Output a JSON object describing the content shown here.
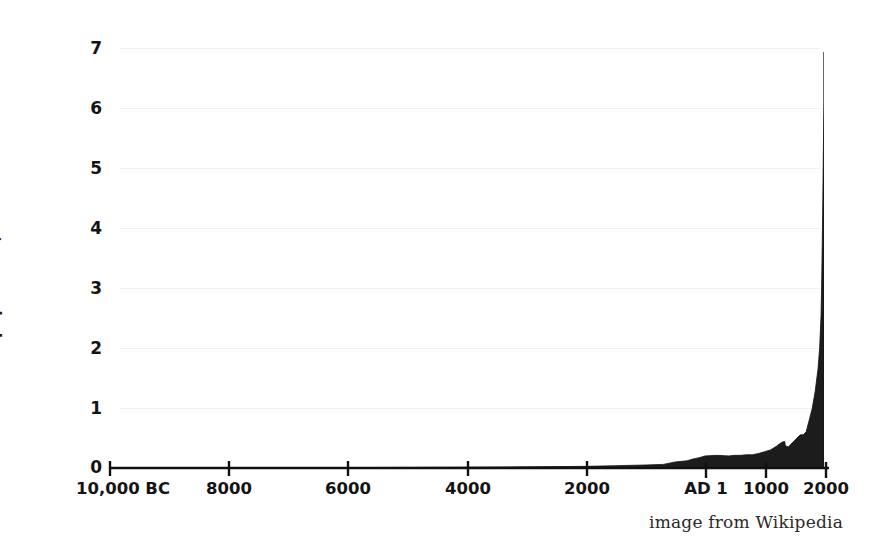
{
  "chart_data": {
    "type": "area",
    "title": "",
    "subtitle": "",
    "xlabel": "",
    "ylabel": "World population, billions",
    "credit": "image from Wikipedia",
    "grid": "faint-horizontal",
    "legend": "none",
    "legend_position": "none",
    "fill_color": "#1c1c1c",
    "line_color": "#111111",
    "background_color": "#ffffff",
    "xlim": [
      -10000,
      2000
    ],
    "ylim": [
      0,
      7
    ],
    "x_tick_values": [
      -10000,
      -8000,
      -6000,
      -4000,
      -2000,
      1,
      1000,
      2000
    ],
    "x_tick_labels": [
      "10,000 BC",
      "8000",
      "6000",
      "4000",
      "2000",
      "AD 1",
      "1000",
      "2000"
    ],
    "y_tick_values": [
      0,
      1,
      2,
      3,
      4,
      5,
      6,
      7
    ],
    "y_tick_labels": [
      "0",
      "1",
      "2",
      "3",
      "4",
      "5",
      "6",
      "7"
    ],
    "x": [
      -10000,
      -9000,
      -8000,
      -7000,
      -6000,
      -5000,
      -4000,
      -3000,
      -2000,
      -1500,
      -1000,
      -700,
      -500,
      -300,
      -200,
      -100,
      1,
      200,
      400,
      500,
      600,
      700,
      800,
      900,
      1000,
      1100,
      1200,
      1250,
      1300,
      1340,
      1350,
      1400,
      1500,
      1600,
      1650,
      1700,
      1750,
      1800,
      1850,
      1900,
      1927,
      1950,
      1960,
      1970,
      1980,
      1990,
      1999,
      2000,
      2010
    ],
    "y": [
      0.004,
      0.005,
      0.005,
      0.006,
      0.007,
      0.01,
      0.014,
      0.02,
      0.027,
      0.038,
      0.05,
      0.06,
      0.1,
      0.12,
      0.15,
      0.17,
      0.2,
      0.21,
      0.2,
      0.21,
      0.21,
      0.22,
      0.22,
      0.24,
      0.27,
      0.3,
      0.36,
      0.4,
      0.43,
      0.44,
      0.37,
      0.35,
      0.45,
      0.55,
      0.55,
      0.6,
      0.79,
      0.98,
      1.26,
      1.65,
      2.0,
      2.52,
      3.02,
      3.7,
      4.44,
      5.31,
      6.0,
      6.08,
      6.9
    ],
    "series": [
      {
        "name": "World population",
        "units": "billions",
        "points": [
          {
            "year": "10,000 BC",
            "population": 0.004
          },
          {
            "year": "8000 BC",
            "population": 0.005
          },
          {
            "year": "6000 BC",
            "population": 0.007
          },
          {
            "year": "4000 BC",
            "population": 0.014
          },
          {
            "year": "2000 BC",
            "population": 0.027
          },
          {
            "year": "1000 BC",
            "population": 0.05
          },
          {
            "year": "500 BC",
            "population": 0.1
          },
          {
            "year": "AD 1",
            "population": 0.2
          },
          {
            "year": "AD 500",
            "population": 0.21
          },
          {
            "year": "AD 1000",
            "population": 0.27
          },
          {
            "year": "AD 1340",
            "population": 0.44
          },
          {
            "year": "AD 1400",
            "population": 0.35
          },
          {
            "year": "AD 1500",
            "population": 0.45
          },
          {
            "year": "AD 1700",
            "population": 0.6
          },
          {
            "year": "AD 1800",
            "population": 0.98
          },
          {
            "year": "AD 1900",
            "population": 1.65
          },
          {
            "year": "AD 1927",
            "population": 2.0
          },
          {
            "year": "AD 1960",
            "population": 3.02
          },
          {
            "year": "AD 1974",
            "population": 4.0
          },
          {
            "year": "AD 1987",
            "population": 5.0
          },
          {
            "year": "AD 1999",
            "population": 6.0
          },
          {
            "year": "AD 2000",
            "population": 6.08
          },
          {
            "year": "AD 2010",
            "population": 6.9
          }
        ]
      }
    ],
    "annotations": [
      {
        "label": "Black Death dip",
        "near_year": "AD 1350",
        "visible_as": "small notch in curve"
      }
    ]
  },
  "axes": {
    "y_title": "World population, billions",
    "y_ticks": [
      "7",
      "6",
      "5",
      "4",
      "3",
      "2",
      "1",
      "0"
    ],
    "x_ticks": [
      "10,000 BC",
      "8000",
      "6000",
      "4000",
      "2000",
      "AD 1",
      "1000",
      "2000"
    ]
  },
  "credit": {
    "text": "image from Wikipedia"
  }
}
